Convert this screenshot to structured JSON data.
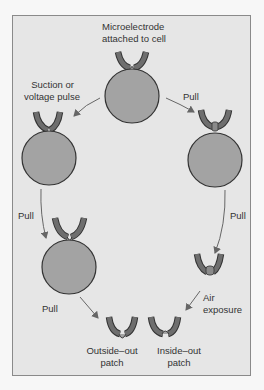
{
  "diagram": {
    "type": "patch-clamp configurations flow",
    "colors": {
      "background": "#e6e6e6",
      "frame_border": "#8a8a8a",
      "cell_fill": "#a3a3a3",
      "electrode_fill": "#6e6e6e",
      "outline": "#333333",
      "arrow": "#666666"
    },
    "labels": {
      "top_line1": "Microelectrode",
      "top_line2": "attached to cell",
      "suction_line1": "Suction or",
      "suction_line2": "voltage pulse",
      "pull_right_top": "Pull",
      "pull_left_mid": "Pull",
      "pull_right_mid": "Pull",
      "pull_left_bottom": "Pull",
      "air_line1": "Air",
      "air_line2": "exposure",
      "outside_out_line1": "Outside–out",
      "outside_out_line2": "patch",
      "inside_out_line1": "Inside–out",
      "inside_out_line2": "patch"
    },
    "nodes": [
      {
        "id": "cell-attached",
        "label": "Microelectrode attached to cell"
      },
      {
        "id": "whole-cell",
        "label": "Whole-cell (after suction or voltage pulse)"
      },
      {
        "id": "vesicle-on-tip",
        "label": "Cell pulled with vesicle at tip"
      },
      {
        "id": "whole-cell-pulled",
        "label": "Whole-cell being pulled"
      },
      {
        "id": "closed-vesicle",
        "label": "Closed vesicle at tip"
      },
      {
        "id": "outside-out",
        "label": "Outside–out patch"
      },
      {
        "id": "inside-out",
        "label": "Inside–out patch"
      }
    ],
    "edges": [
      {
        "from": "cell-attached",
        "to": "whole-cell",
        "label": "Suction or voltage pulse"
      },
      {
        "from": "cell-attached",
        "to": "vesicle-on-tip",
        "label": "Pull"
      },
      {
        "from": "whole-cell",
        "to": "whole-cell-pulled",
        "label": "Pull"
      },
      {
        "from": "vesicle-on-tip",
        "to": "closed-vesicle",
        "label": "Pull"
      },
      {
        "from": "whole-cell-pulled",
        "to": "outside-out",
        "label": "Pull"
      },
      {
        "from": "closed-vesicle",
        "to": "inside-out",
        "label": "Air exposure"
      }
    ]
  }
}
